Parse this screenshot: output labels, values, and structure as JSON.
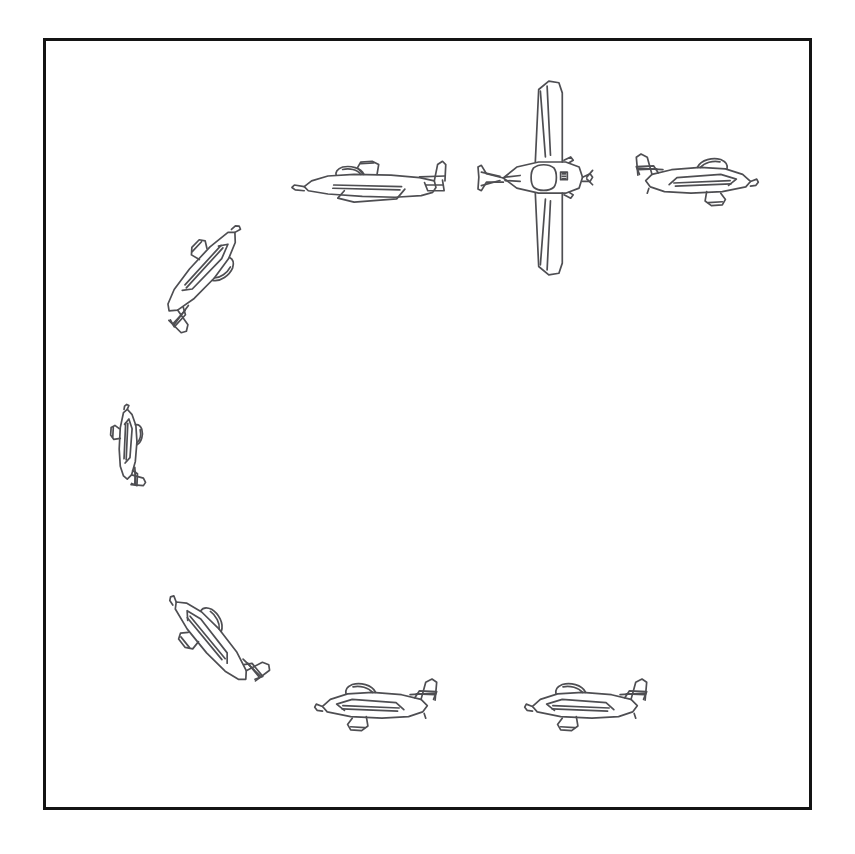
{
  "figure": {
    "kind": "line-drawing-illustration",
    "arrangement": "eight copies of the same aeroplane drawing arranged around a circle, each at a different rotation",
    "background_color": "#ffffff",
    "frame": {
      "border_color": "#141414",
      "border_width_px": 3,
      "x": 43,
      "y": 38,
      "width": 769,
      "height": 772
    },
    "stroke_color": "#4e4e52",
    "count": 8
  },
  "planes": [
    {
      "id": "plane-top-left-inverted",
      "view": "side",
      "label": "aeroplane inverted, nose right",
      "x": 288,
      "y": 140,
      "width": 165,
      "height": 90,
      "rotation_deg": 180,
      "flip": "vertical",
      "clock_position": "11 o'clock"
    },
    {
      "id": "plane-top-center-plan",
      "view": "plan",
      "label": "aeroplane top-down view, nose right",
      "x": 478,
      "y": 72,
      "width": 118,
      "height": 212,
      "rotation_deg": 0,
      "flip": "none",
      "clock_position": "12 o'clock"
    },
    {
      "id": "plane-top-right",
      "view": "side",
      "label": "aeroplane upright, nose right",
      "x": 628,
      "y": 140,
      "width": 130,
      "height": 86,
      "rotation_deg": 0,
      "flip": "none",
      "clock_position": "1 o'clock"
    },
    {
      "id": "plane-upper-left-diagonal",
      "view": "side",
      "label": "aeroplane tilted nose up-right about 45 degrees",
      "x": 135,
      "y": 212,
      "width": 128,
      "height": 124,
      "rotation_deg": -50,
      "flip": "vertical",
      "clock_position": "10 o'clock"
    },
    {
      "id": "plane-left-vertical",
      "view": "side",
      "label": "aeroplane nose up, vertical",
      "x": 84,
      "y": 378,
      "width": 86,
      "height": 140,
      "rotation_deg": -90,
      "flip": "vertical",
      "clock_position": "9 o'clock"
    },
    {
      "id": "plane-lower-left-diagonal",
      "view": "side",
      "label": "aeroplane tilted nose up-left about 135 degrees",
      "x": 148,
      "y": 585,
      "width": 130,
      "height": 118,
      "rotation_deg": -132,
      "flip": "vertical",
      "clock_position": "8 o'clock"
    },
    {
      "id": "plane-bottom-left",
      "view": "side",
      "label": "aeroplane upright, nose left",
      "x": 308,
      "y": 665,
      "width": 144,
      "height": 86,
      "rotation_deg": 0,
      "flip": "horizontal",
      "clock_position": "7 o'clock"
    },
    {
      "id": "plane-bottom-right",
      "view": "side",
      "label": "aeroplane upright, nose left",
      "x": 518,
      "y": 665,
      "width": 144,
      "height": 86,
      "rotation_deg": 0,
      "flip": "horizontal",
      "clock_position": "5 o'clock"
    }
  ]
}
